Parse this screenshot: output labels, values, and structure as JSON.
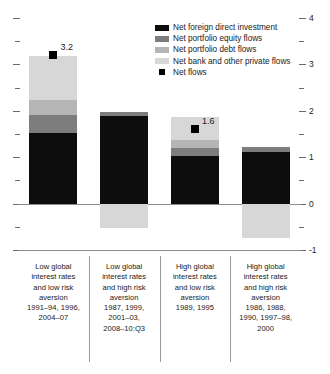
{
  "chart_data": {
    "type": "bar",
    "stacked": true,
    "title": "",
    "subtitle": "",
    "xlabel": "",
    "ylabel": "",
    "ylim": [
      -1,
      4
    ],
    "y_major_ticks": [
      4,
      3,
      2,
      1,
      0,
      -1
    ],
    "y_major_tick_labels": [
      "4",
      "3",
      "2",
      "1",
      "0",
      "-1"
    ],
    "y_minor_ticks": [
      3.5,
      2.5,
      1.5,
      0.5,
      -0.5
    ],
    "grid": false,
    "legend_position": "top-right",
    "categories": [
      "Low global interest rates and low risk aversion 1991–94, 1996, 2004–07",
      "Low global interest rates and high risk aversion 1987, 1999, 2001–03, 2008–10:Q3",
      "High global interest rates and low risk aversion 1989, 1995",
      "High global interest rates and high risk aversion 1986, 1988, 1990, 1997–98, 2000"
    ],
    "series": [
      {
        "name": "Net foreign direct investment",
        "color": "#0d0d0d",
        "values": [
          1.52,
          1.88,
          1.02,
          1.12
        ]
      },
      {
        "name": "Net portfolio equity flows",
        "color": "#7d7d7d",
        "values": [
          0.38,
          0.1,
          0.18,
          0.11
        ]
      },
      {
        "name": "Net portfolio debt flows",
        "color": "#b5b5b5",
        "values": [
          0.34,
          0.0,
          0.16,
          0.0
        ]
      },
      {
        "name": "Net bank and other private flows",
        "color": "#d7d7d7",
        "values": [
          0.95,
          -0.52,
          0.5,
          -0.74
        ]
      }
    ],
    "markers": {
      "name": "Net flows",
      "color": "#000000",
      "values": [
        3.2,
        null,
        1.6,
        null
      ],
      "labels": [
        "3.2",
        null,
        "1.6",
        null
      ]
    }
  },
  "legend": {
    "items": [
      {
        "label": "Net foreign direct investment",
        "swatch": "bar",
        "color": "#0d0d0d"
      },
      {
        "label": "Net portfolio equity flows",
        "swatch": "bar",
        "color": "#7d7d7d"
      },
      {
        "label": "Net portfolio debt flows",
        "swatch": "bar",
        "color": "#b5b5b5"
      },
      {
        "label": "Net bank and other private flows",
        "swatch": "bar",
        "color": "#d7d7d7"
      },
      {
        "label": "Net flows",
        "swatch": "square",
        "color": "#000000"
      }
    ]
  },
  "categories_table": [
    {
      "line1": "Low global",
      "line2": "interest rates",
      "line3": "and low risk",
      "line4": "aversion",
      "line5": "1991–94, 1996,",
      "line6": "2004–07",
      "line7": ""
    },
    {
      "line1": "Low global",
      "line2": "interest rates",
      "line3": "and high risk",
      "line4": "aversion",
      "line5": "1987, 1999,",
      "line6": "2001–03,",
      "line7": "2008–10:Q3"
    },
    {
      "line1": "High global",
      "line2": "interest rates",
      "line3": "and low risk",
      "line4": "aversion",
      "line5": "1989, 1995",
      "line6": "",
      "line7": ""
    },
    {
      "line1": "High global",
      "line2": "interest rates",
      "line3": "and high risk",
      "line4": "aversion",
      "line5": "1986, 1988,",
      "line6": "1990, 1997–98,",
      "line7": "2000"
    }
  ],
  "axis": {
    "labels": [
      "4",
      "3",
      "2",
      "1",
      "0",
      "-1"
    ]
  }
}
